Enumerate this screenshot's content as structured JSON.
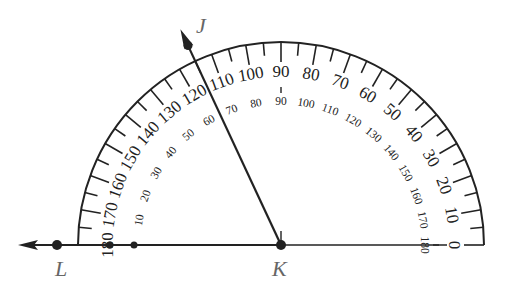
{
  "diagram": {
    "type": "protractor-angle",
    "center": {
      "label": "K",
      "x": 281,
      "y": 245
    },
    "points": [
      {
        "label": "J",
        "role": "ray-endpoint",
        "angle_deg": 115
      },
      {
        "label": "L",
        "role": "ray-endpoint",
        "angle_deg": 180
      },
      {
        "label": "K",
        "role": "vertex"
      }
    ],
    "rays": [
      {
        "name": "ray-KJ",
        "angle_deg": 115
      },
      {
        "name": "ray-KL",
        "angle_deg": 180
      }
    ],
    "protractor": {
      "outer_scale": {
        "start": 0,
        "end": 180,
        "direction": "counterclockwise-from-right",
        "labels": [
          "0",
          "10",
          "20",
          "30",
          "40",
          "50",
          "60",
          "70",
          "80",
          "90",
          "100",
          "110",
          "120",
          "130",
          "140",
          "150",
          "160",
          "170",
          "180"
        ]
      },
      "inner_scale": {
        "start": 0,
        "end": 180,
        "direction": "clockwise-from-left",
        "labels": [
          "0",
          "10",
          "20",
          "30",
          "40",
          "50",
          "60",
          "70",
          "80",
          "90",
          "100",
          "110",
          "120",
          "130",
          "140",
          "150",
          "160",
          "170",
          "180"
        ]
      },
      "radius": 203,
      "tick_step_deg": 5
    },
    "labels": {
      "J": "J",
      "K": "K",
      "L": "L"
    },
    "colors": {
      "line": "#222222",
      "label": "#666666",
      "background": "#ffffff"
    }
  }
}
